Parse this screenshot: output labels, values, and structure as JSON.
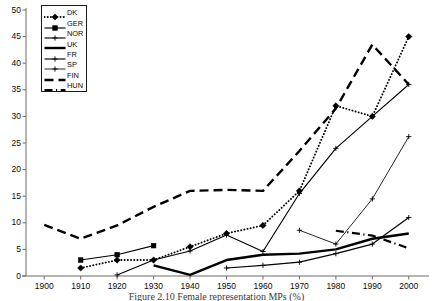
{
  "chart_data": {
    "type": "line",
    "title": "",
    "caption": "Figure 2.10  Female representation MPs (%)",
    "xlabel": "",
    "ylabel": "",
    "xlim": [
      1895,
      2005
    ],
    "ylim": [
      0,
      50
    ],
    "grid": false,
    "legend_position": "top-left",
    "x_ticks": [
      1900,
      1910,
      1920,
      1930,
      1940,
      1950,
      1960,
      1970,
      1980,
      1990,
      2000
    ],
    "y_ticks": [
      0,
      5,
      10,
      15,
      20,
      25,
      30,
      35,
      40,
      45,
      50
    ],
    "series": [
      {
        "name": "DK",
        "style": "dotted",
        "marker": "diamond",
        "color": "#000000",
        "x": [
          1910,
          1920,
          1930,
          1940,
          1950,
          1960,
          1970,
          1980,
          1990,
          2000
        ],
        "values": [
          1.5,
          3.0,
          3.0,
          5.5,
          8.0,
          9.5,
          16.0,
          32.0,
          30.0,
          45.0
        ]
      },
      {
        "name": "GER",
        "style": "solid",
        "marker": "square",
        "color": "#000000",
        "x": [
          1910,
          1920,
          1930
        ],
        "values": [
          3.0,
          4.0,
          5.7
        ]
      },
      {
        "name": "NOR",
        "style": "solid",
        "marker": "plus",
        "color": "#000000",
        "x": [
          1920,
          1930,
          1940,
          1950,
          1960,
          1970,
          1980,
          1990,
          2000
        ],
        "values": [
          0.2,
          3.0,
          4.7,
          7.7,
          4.6,
          15.5,
          24.0,
          30.0,
          36.0
        ]
      },
      {
        "name": "UK",
        "style": "solid-thick",
        "marker": "none",
        "color": "#000000",
        "x": [
          1930,
          1940,
          1950,
          1960,
          1970,
          1980,
          1990,
          2000
        ],
        "values": [
          2.0,
          0.2,
          3.0,
          4.0,
          4.2,
          5.0,
          7.0,
          8.0
        ]
      },
      {
        "name": "FR",
        "style": "solid",
        "marker": "plus",
        "color": "#000000",
        "x": [
          1950,
          1960,
          1970,
          1980,
          1990,
          2000
        ],
        "values": [
          1.5,
          2.0,
          2.6,
          4.2,
          6.0,
          11.0
        ]
      },
      {
        "name": "SP",
        "style": "solid-thin",
        "marker": "plus",
        "color": "#000000",
        "x": [
          1970,
          1980,
          1990,
          2000
        ],
        "values": [
          8.6,
          6.0,
          14.5,
          26.2
        ]
      },
      {
        "name": "FIN",
        "style": "dashed",
        "marker": "none",
        "color": "#000000",
        "x": [
          1900,
          1910,
          1920,
          1930,
          1940,
          1950,
          1960,
          1970,
          1980,
          1990,
          2000
        ],
        "values": [
          9.6,
          7.0,
          9.5,
          13.0,
          16.0,
          16.2,
          16.0,
          23.5,
          31.5,
          43.5,
          36.0
        ]
      },
      {
        "name": "HUN",
        "style": "dash-dot",
        "marker": "none",
        "color": "#000000",
        "x": [
          1980,
          1990,
          2000
        ],
        "values": [
          8.5,
          7.6,
          5.2
        ]
      }
    ]
  },
  "legend": {
    "entries": [
      {
        "label": "DK",
        "style": "dotted",
        "marker": "diamond"
      },
      {
        "label": "GER",
        "style": "solid",
        "marker": "square"
      },
      {
        "label": "NOR",
        "style": "solid",
        "marker": "plus"
      },
      {
        "label": "UK",
        "style": "solid-thick",
        "marker": "none"
      },
      {
        "label": "FR",
        "style": "solid",
        "marker": "plus"
      },
      {
        "label": "SP",
        "style": "solid-thin",
        "marker": "plus"
      },
      {
        "label": "FIN",
        "style": "dashed",
        "marker": "none"
      },
      {
        "label": "HUN",
        "style": "dash-dot",
        "marker": "none"
      }
    ]
  },
  "axes": {
    "y_tick_labels": [
      "50",
      "45",
      "40",
      "35",
      "30",
      "25",
      "20",
      "15",
      "10",
      "5",
      "0"
    ],
    "x_tick_labels": [
      "1900",
      "1910",
      "1920",
      "1930",
      "1940",
      "1950",
      "1960",
      "1970",
      "1980",
      "1990",
      "2000"
    ]
  },
  "colors": {
    "axis": "#6b6b6b",
    "ink": "#000000",
    "background": "#ffffff"
  }
}
